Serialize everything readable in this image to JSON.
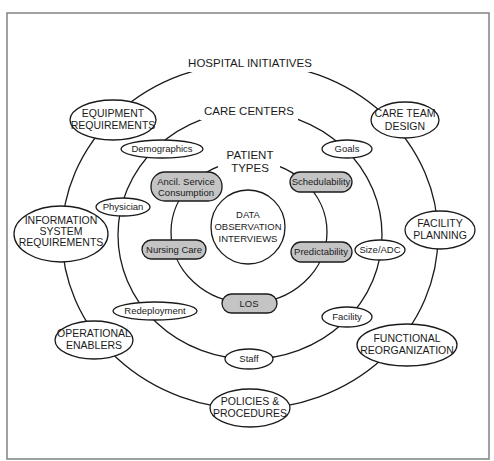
{
  "diagram": {
    "rings": {
      "outer": {
        "title": "HOSPITAL INITIATIVES"
      },
      "middle": {
        "title": "CARE CENTERS"
      },
      "inner": {
        "title_line1": "PATIENT",
        "title_line2": "TYPES"
      }
    },
    "center": {
      "line1": "DATA",
      "line2": "OBSERVATION",
      "line3": "INTERVIEWS"
    },
    "outer_nodes": {
      "equipment": {
        "line1": "EQUIPMENT",
        "line2": "REQUIREMENTS"
      },
      "care_team": {
        "line1": "CARE TEAM",
        "line2": "DESIGN"
      },
      "information": {
        "line1": "INFORMATION",
        "line2": "SYSTEM",
        "line3": "REQUIREMENTS"
      },
      "facility_planning": {
        "line1": "FACILITY",
        "line2": "PLANNING"
      },
      "operational": {
        "line1": "OPERATIONAL",
        "line2": "ENABLERS"
      },
      "functional": {
        "line1": "FUNCTIONAL",
        "line2": "REORGANIZATION"
      },
      "policies": {
        "line1": "POLICIES &",
        "line2": "PROCEDURES"
      }
    },
    "middle_nodes": {
      "demographics": "Demographics",
      "goals": "Goals",
      "physician": "Physician",
      "size_adc": "Size/ADC",
      "redeployment": "Redeployment",
      "facility": "Facility",
      "staff": "Staff"
    },
    "inner_nodes": {
      "ancil": {
        "line1": "Ancil. Service",
        "line2": "Consumption"
      },
      "schedulability": "Schedulability",
      "nursing_care": "Nursing Care",
      "predictability": "Predictability",
      "los": "LOS"
    },
    "colors": {
      "stroke": "#1a1a1a",
      "highlight_fill": "#c4c4c4",
      "frame": "#8a8a8a"
    }
  }
}
